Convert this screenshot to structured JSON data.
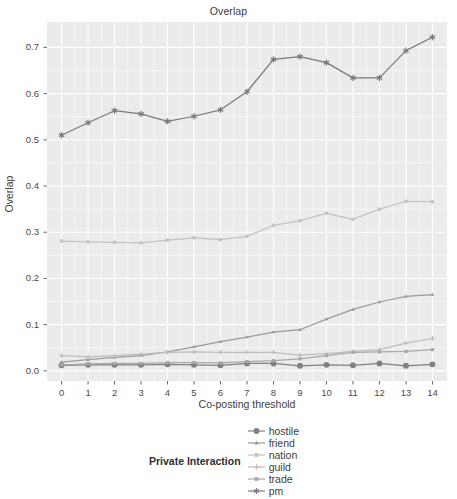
{
  "chart_data": {
    "type": "line",
    "title": "Overlap",
    "xlabel": "Co-posting threshold",
    "ylabel": "Overlap",
    "x": [
      0,
      1,
      2,
      3,
      4,
      5,
      6,
      7,
      8,
      9,
      10,
      11,
      12,
      13,
      14
    ],
    "xlim": [
      -0.55,
      14.55
    ],
    "ylim": [
      -0.022,
      0.755
    ],
    "xticks": [
      "0",
      "1",
      "2",
      "3",
      "4",
      "5",
      "6",
      "7",
      "8",
      "9",
      "10",
      "11",
      "12",
      "13",
      "14"
    ],
    "yticks": [
      "0.0",
      "0.1",
      "0.2",
      "0.3",
      "0.4",
      "0.5",
      "0.6",
      "0.7"
    ],
    "ytick_values": [
      0.0,
      0.1,
      0.2,
      0.3,
      0.4,
      0.5,
      0.6,
      0.7
    ],
    "grid": true,
    "grid_color": "#ffffff",
    "panel_bg": "#ebebeb",
    "legend_position": "bottom",
    "legend_title": "Private Interaction",
    "series": [
      {
        "name": "hostile",
        "marker": "circle",
        "color": "#808080",
        "values": [
          0.012,
          0.013,
          0.013,
          0.013,
          0.014,
          0.013,
          0.012,
          0.016,
          0.016,
          0.011,
          0.013,
          0.012,
          0.016,
          0.011,
          0.014
        ]
      },
      {
        "name": "friend",
        "marker": "triangle",
        "color": "#9a9a9a",
        "values": [
          0.019,
          0.024,
          0.029,
          0.033,
          0.041,
          0.052,
          0.063,
          0.073,
          0.084,
          0.089,
          0.112,
          0.133,
          0.149,
          0.161,
          0.165
        ]
      },
      {
        "name": "nation",
        "marker": "square",
        "color": "#c2c2c2",
        "values": [
          0.281,
          0.279,
          0.278,
          0.277,
          0.283,
          0.288,
          0.284,
          0.291,
          0.315,
          0.325,
          0.341,
          0.328,
          0.35,
          0.367,
          0.366
        ]
      },
      {
        "name": "guild",
        "marker": "plus",
        "color": "#bdbdbd",
        "values": [
          0.033,
          0.03,
          0.033,
          0.036,
          0.04,
          0.041,
          0.04,
          0.04,
          0.04,
          0.034,
          0.037,
          0.042,
          0.046,
          0.06,
          0.07
        ]
      },
      {
        "name": "trade",
        "marker": "square",
        "color": "#a8a8a8",
        "values": [
          0.013,
          0.015,
          0.016,
          0.016,
          0.018,
          0.018,
          0.017,
          0.02,
          0.022,
          0.026,
          0.033,
          0.04,
          0.041,
          0.042,
          0.046
        ]
      },
      {
        "name": "pm",
        "marker": "asterisk",
        "color": "#7a7a7a",
        "values": [
          0.51,
          0.537,
          0.563,
          0.556,
          0.54,
          0.551,
          0.565,
          0.604,
          0.674,
          0.68,
          0.667,
          0.634,
          0.634,
          0.693,
          0.722
        ]
      }
    ]
  }
}
